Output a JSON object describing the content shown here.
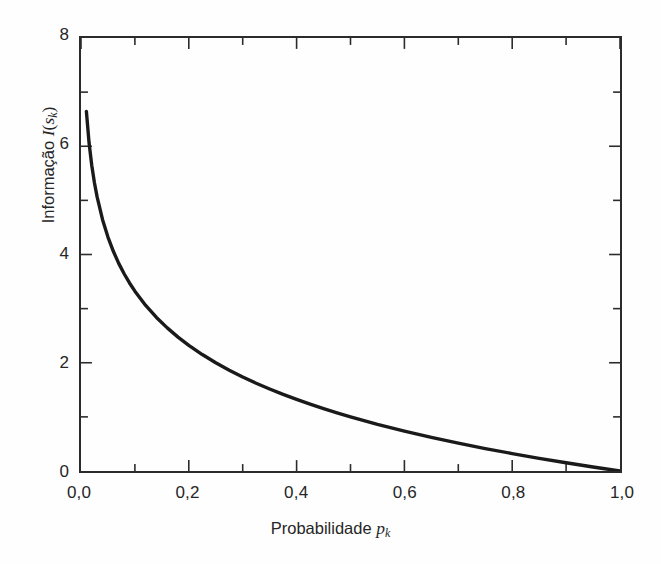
{
  "figure": {
    "background_color": "#fefefe",
    "ink_color": "#2b2b2b",
    "curve_color": "#1a1a1a"
  },
  "axes": {
    "x": {
      "title_prefix": "Probabilidade ",
      "title_var": "p",
      "title_sub": "k",
      "min": 0,
      "max": 1.0,
      "tick_labels": [
        "0,0",
        "0,2",
        "0,4",
        "0,6",
        "0,8",
        "1,0"
      ],
      "tick_values": [
        0.0,
        0.2,
        0.4,
        0.6,
        0.8,
        1.0
      ],
      "minor_tick_values": [
        0.1,
        0.3,
        0.5,
        0.7,
        0.9
      ]
    },
    "y": {
      "title_prefix": "Informação ",
      "title_var": "I",
      "title_open": "(",
      "title_var2": "s",
      "title_sub": "k",
      "title_close": ")",
      "min": 0,
      "max": 8,
      "tick_labels": [
        "0",
        "2",
        "4",
        "6",
        "8"
      ],
      "tick_values": [
        0,
        2,
        4,
        6,
        8
      ],
      "minor_tick_values": [
        1,
        3,
        5,
        7
      ]
    }
  },
  "chart_data": {
    "type": "line",
    "title": "",
    "subtitle": "",
    "xlabel": "Probabilidade p_k",
    "ylabel": "Informação I(s_k)",
    "xlim": [
      0.0,
      1.0
    ],
    "ylim": [
      0,
      8
    ],
    "grid": false,
    "legend": null,
    "annotations": [],
    "series": [
      {
        "name": "I(s_k) = log2(1/p_k)",
        "x": [
          0.01,
          0.015,
          0.02,
          0.025,
          0.03,
          0.04,
          0.05,
          0.06,
          0.07,
          0.08,
          0.09,
          0.1,
          0.12,
          0.14,
          0.16,
          0.18,
          0.2,
          0.225,
          0.25,
          0.275,
          0.3,
          0.325,
          0.35,
          0.375,
          0.4,
          0.425,
          0.45,
          0.475,
          0.5,
          0.55,
          0.6,
          0.65,
          0.7,
          0.75,
          0.8,
          0.85,
          0.9,
          0.95,
          0.975,
          1.0
        ],
        "values": [
          6.644,
          6.059,
          5.644,
          5.322,
          5.059,
          4.644,
          4.322,
          4.059,
          3.836,
          3.644,
          3.474,
          3.322,
          3.059,
          2.837,
          2.644,
          2.474,
          2.322,
          2.152,
          2.0,
          1.862,
          1.737,
          1.621,
          1.515,
          1.415,
          1.322,
          1.234,
          1.152,
          1.074,
          1.0,
          0.862,
          0.737,
          0.621,
          0.515,
          0.415,
          0.322,
          0.234,
          0.152,
          0.074,
          0.037,
          0.0
        ]
      }
    ]
  }
}
